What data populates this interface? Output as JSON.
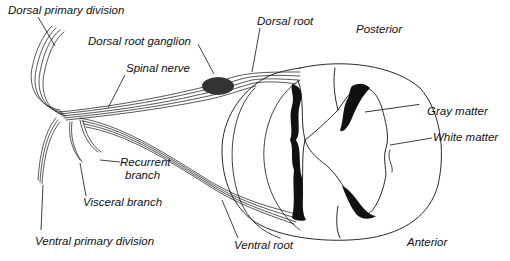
{
  "diagram": {
    "orientation": {
      "top": "Posterior",
      "bottom": "Anterior"
    },
    "labels": {
      "dorsal_primary_division": "Dorsal primary division",
      "dorsal_root_ganglion": "Dorsal root ganglion",
      "dorsal_root": "Dorsal root",
      "posterior": "Posterior",
      "spinal_nerve": "Spinal nerve",
      "gray_matter": "Gray matter",
      "white_matter": "White matter",
      "recurrent_branch_line1": "Recurrent",
      "recurrent_branch_line2": "branch",
      "visceral_branch": "Visceral branch",
      "ventral_primary_division": "Ventral primary division",
      "ventral_root": "Ventral root",
      "anterior": "Anterior"
    },
    "colors": {
      "ink": "#111111",
      "background": "#ffffff"
    }
  }
}
